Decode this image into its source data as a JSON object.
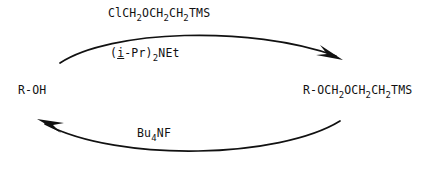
{
  "scheme": {
    "title": "SEM protection and deprotection of an alcohol",
    "background_color": "#ffffff",
    "ink_color": "#111111"
  },
  "species": {
    "substrate": "R-OH",
    "product_prefix": "R-OCH",
    "product_sub1": "2",
    "product_mid1": "OCH",
    "product_sub2": "2",
    "product_mid2": "CH",
    "product_sub3": "2",
    "product_suffix": "TMS"
  },
  "reagents": {
    "top_prefix": "ClCH",
    "top_sub1": "2",
    "top_mid1": "OCH",
    "top_sub2": "2",
    "top_mid2": "CH",
    "top_sub3": "2",
    "top_suffix": "TMS",
    "base_open": "(",
    "base_italic": "i",
    "base_mid": "-Pr)",
    "base_sub": "2",
    "base_end": "NEt",
    "bottom_prefix": "Bu",
    "bottom_sub": "4",
    "bottom_suffix": "NF"
  },
  "arrows": {
    "forward_name": "protection-arrow",
    "forward_direction": "left-to-right",
    "reverse_name": "deprotection-arrow",
    "reverse_direction": "right-to-left"
  }
}
